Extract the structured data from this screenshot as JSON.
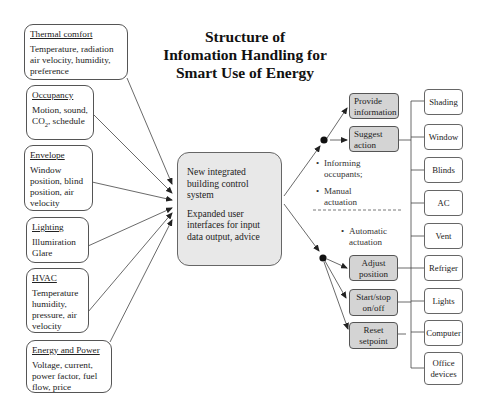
{
  "title": {
    "line1": "Structure of",
    "line2": "Infomation Handling for",
    "line3": "Smart Use of Energy"
  },
  "inputs": [
    {
      "heading": "Thermal comfort",
      "text": "Temperature, radiation air velocity, humidity, preference"
    },
    {
      "heading": "Occupancy",
      "text_pre": "Motion, sound, CO",
      "text_sub": "2",
      "text_post": ", schedule"
    },
    {
      "heading": "Envelope",
      "text": "Window position, blind position, air velocity"
    },
    {
      "heading": "Lighting",
      "text": "Illumiration Glare"
    },
    {
      "heading": "HVAC",
      "text": "Temperature humidity, pressure, air velocity"
    },
    {
      "heading": "Energy and Power",
      "text": "Voltage, current, power factor, fuel flow, price"
    }
  ],
  "central": {
    "line1": "New integrated building control system",
    "line2": "Expanded user interfaces for input data output, advice"
  },
  "actions_upper": [
    {
      "label": "Provide information"
    },
    {
      "label": "Suggest action"
    }
  ],
  "bullets_upper": [
    "Informing occupants;",
    "Manual actuation"
  ],
  "bullets_lower": [
    "Automatic actuation"
  ],
  "actions_lower": [
    {
      "label": "Adjust position"
    },
    {
      "label": "Start/stop on/off"
    },
    {
      "label": "Reset setpoint"
    }
  ],
  "devices": [
    "Shading",
    "Window",
    "Blinds",
    "AC",
    "Vent",
    "Refriger",
    "Lights",
    "Computer",
    "Office devices"
  ],
  "colors": {
    "central_fill": "#e8e8e8",
    "action_fill": "#d4d4d4",
    "line": "#333333"
  }
}
